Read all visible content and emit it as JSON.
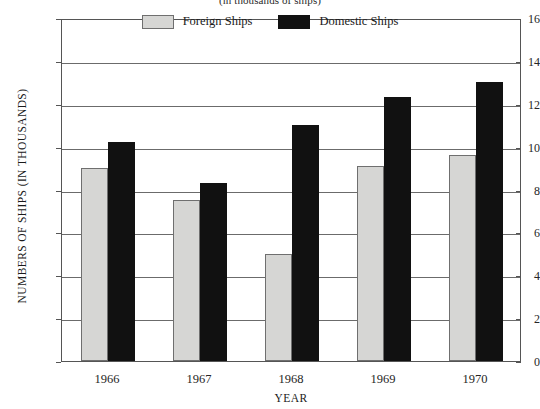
{
  "chart_data": {
    "type": "bar",
    "title": "(in thousands of ships)",
    "xlabel": "YEAR",
    "ylabel": "NUMBERS OF SHIPS (IN THOUSANDS)",
    "categories": [
      "1966",
      "1967",
      "1968",
      "1969",
      "1970"
    ],
    "series": [
      {
        "name": "Foreign Ships",
        "color": "#d6d6d4",
        "values": [
          9.0,
          7.5,
          5.0,
          9.1,
          9.6
        ]
      },
      {
        "name": "Domestic Ships",
        "color": "#111111",
        "values": [
          10.2,
          8.3,
          11.0,
          12.3,
          13.0
        ]
      }
    ],
    "ylim": [
      0,
      16
    ],
    "yticks": [
      "0",
      "2",
      "4",
      "6",
      "8",
      "10",
      "12",
      "14",
      "16"
    ],
    "ytick_values": [
      0,
      2,
      4,
      6,
      8,
      10,
      12,
      14,
      16
    ],
    "grid": true,
    "legend_position": "top-center"
  }
}
